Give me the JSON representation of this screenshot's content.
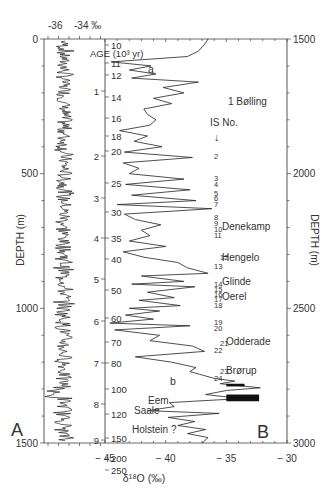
{
  "chart_data": [
    {
      "panel": "A",
      "type": "line",
      "title": "",
      "xlabel": "δ18O (‰)",
      "ylabel": "DEPTH (m)",
      "top_axis_labels": [
        "-36",
        "-34 ‰"
      ],
      "y_ticks": [
        0,
        500,
        1000,
        1500
      ],
      "ylim": [
        0,
        1500
      ],
      "xlim": [
        -38,
        -32
      ],
      "grid": false,
      "description": "Holocene section: δ18O stable around -35 ‰ with high-frequency noise, depth 0-1500 m"
    },
    {
      "panel": "B",
      "type": "line",
      "xlabel": "δ18O (‰)",
      "ylabel": "DEPTH (m)",
      "x_ticks": [
        -45,
        -40,
        -35,
        -30
      ],
      "xlim": [
        -45,
        -30
      ],
      "y_ticks": [
        1500,
        2000,
        2500,
        3000
      ],
      "ylim": [
        1500,
        3000
      ],
      "grid": false,
      "age_scale": {
        "label": "AGE (10³ yr)",
        "ticks": [
          "10",
          "11",
          "12",
          "14",
          "16",
          "18",
          "20",
          "25",
          "30",
          "35",
          "40",
          "50",
          "60",
          "70",
          "80",
          "100",
          "120",
          "150",
          "200",
          "250"
        ]
      },
      "inner_depth_km_ticks": [
        "1",
        "2",
        "3",
        "4",
        "5",
        "6",
        "7",
        "8",
        "9"
      ],
      "interstadials_header": "IS No.",
      "interstadials": [
        "1",
        "2",
        "3",
        "4",
        "5",
        "6",
        "7",
        "8",
        "9",
        "10",
        "11",
        "12",
        "13",
        "14",
        "15",
        "16",
        "17",
        "18",
        "19",
        "20",
        "21",
        "22",
        "23",
        "24"
      ],
      "annotations": [
        "a",
        "b",
        "Bølling",
        "Denekamp",
        "Hengelo",
        "Glinde",
        "Oerel",
        "Odderade",
        "Brørup",
        "Eem",
        "Saale",
        "Holstein ?"
      ],
      "profile": [
        [
          1500,
          -36.5
        ],
        [
          1520,
          -36.8
        ],
        [
          1545,
          -37.3
        ],
        [
          1565,
          -38.2
        ],
        [
          1585,
          -44.5
        ],
        [
          1600,
          -41.2
        ],
        [
          1615,
          -43.0
        ],
        [
          1630,
          -40.8
        ],
        [
          1645,
          -42.8
        ],
        [
          1660,
          -37.3
        ],
        [
          1680,
          -40.2
        ],
        [
          1700,
          -38.5
        ],
        [
          1720,
          -41.0
        ],
        [
          1740,
          -39.5
        ],
        [
          1760,
          -41.8
        ],
        [
          1780,
          -41.5
        ],
        [
          1800,
          -40.8
        ],
        [
          1820,
          -41.3
        ],
        [
          1840,
          -43.8
        ],
        [
          1860,
          -41.5
        ],
        [
          1880,
          -42.6
        ],
        [
          1900,
          -40.3
        ],
        [
          1920,
          -43.4
        ],
        [
          1940,
          -37.8
        ],
        [
          1960,
          -43.5
        ],
        [
          1980,
          -42.2
        ],
        [
          2000,
          -43.0
        ],
        [
          2020,
          -38.5
        ],
        [
          2040,
          -43.3
        ],
        [
          2060,
          -38.0
        ],
        [
          2080,
          -42.8
        ],
        [
          2100,
          -37.5
        ],
        [
          2115,
          -44.0
        ],
        [
          2130,
          -36.2
        ],
        [
          2150,
          -43.4
        ],
        [
          2170,
          -42.5
        ],
        [
          2190,
          -40.4
        ],
        [
          2210,
          -42.0
        ],
        [
          2230,
          -41.3
        ],
        [
          2250,
          -43.0
        ],
        [
          2270,
          -40.0
        ],
        [
          2290,
          -43.5
        ],
        [
          2310,
          -41.8
        ],
        [
          2330,
          -39.0
        ],
        [
          2350,
          -38.2
        ],
        [
          2370,
          -36.5
        ],
        [
          2380,
          -42.0
        ],
        [
          2400,
          -38.5
        ],
        [
          2410,
          -42.8
        ],
        [
          2420,
          -37.6
        ],
        [
          2440,
          -41.5
        ],
        [
          2460,
          -39.3
        ],
        [
          2470,
          -42.2
        ],
        [
          2490,
          -38.8
        ],
        [
          2500,
          -43.0
        ],
        [
          2510,
          -40.5
        ],
        [
          2525,
          -43.3
        ],
        [
          2540,
          -41.0
        ],
        [
          2555,
          -44.6
        ],
        [
          2565,
          -38.0
        ],
        [
          2580,
          -44.2
        ],
        [
          2600,
          -40.5
        ],
        [
          2620,
          -41.3
        ],
        [
          2640,
          -37.8
        ],
        [
          2660,
          -36.8
        ],
        [
          2680,
          -42.5
        ],
        [
          2700,
          -39.5
        ],
        [
          2720,
          -37.5
        ],
        [
          2735,
          -38.0
        ],
        [
          2745,
          -37.2
        ],
        [
          2760,
          -36.0
        ],
        [
          2770,
          -34.3
        ],
        [
          2780,
          -35.5
        ],
        [
          2795,
          -32.2
        ],
        [
          2805,
          -35.0
        ],
        [
          2820,
          -36.7
        ],
        [
          2835,
          -33.8
        ],
        [
          2850,
          -39.7
        ],
        [
          2865,
          -39.3
        ],
        [
          2880,
          -41.5
        ],
        [
          2890,
          -35.6
        ],
        [
          2905,
          -39.8
        ],
        [
          2920,
          -37.6
        ],
        [
          2935,
          -39.0
        ],
        [
          2950,
          -36.7
        ],
        [
          2965,
          -38.2
        ],
        [
          2980,
          -36.5
        ],
        [
          3000,
          -37.0
        ]
      ]
    }
  ],
  "labels": {
    "panel_a": "A",
    "panel_b": "B",
    "top_scale": "-36  -34 ‰",
    "age_axis": "AGE (10³ yr)",
    "depth_axis_left": "DEPTH (m)",
    "depth_axis_right": "DEPTH (m)",
    "x_axis_title": "δ¹⁸O  (‰)",
    "is_header": "IS No."
  }
}
